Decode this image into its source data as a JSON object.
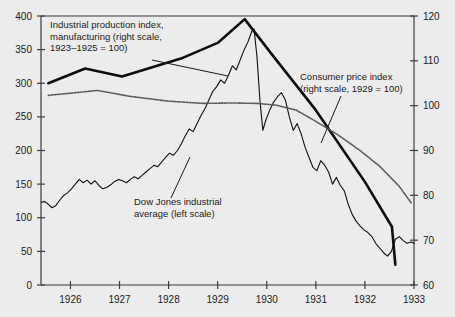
{
  "chart_data": {
    "type": "line",
    "title": "",
    "subtitle": "",
    "xlabel": "",
    "grid": false,
    "legend_position": "inline-annotations",
    "x": [
      1925.4,
      1933.0
    ],
    "xlim": [
      1925.4,
      1933.0
    ],
    "x_ticks": [
      1926,
      1927,
      1928,
      1929,
      1930,
      1931,
      1932,
      1933
    ],
    "x_tick_labels": [
      "1926",
      "1927",
      "1928",
      "1929",
      "1930",
      "1931",
      "1932",
      "1933"
    ],
    "left_axis": {
      "label": "",
      "ylim": [
        0,
        400
      ],
      "ticks": [
        0,
        50,
        100,
        150,
        200,
        250,
        300,
        350,
        400
      ],
      "tick_labels": [
        "0",
        "50",
        "100",
        "150",
        "200",
        "250",
        "300",
        "350",
        "400"
      ]
    },
    "right_axis": {
      "label": "",
      "ylim": [
        60,
        120
      ],
      "ticks": [
        60,
        70,
        80,
        90,
        100,
        110,
        120
      ],
      "tick_labels": [
        "60",
        "70",
        "80",
        "90",
        "100",
        "110",
        "120"
      ]
    },
    "series": [
      {
        "name": "Dow Jones industrial average (left scale)",
        "axis": "left",
        "style": "thin-solid",
        "color": "#111111",
        "points": [
          [
            1925.4,
            123
          ],
          [
            1925.48,
            124
          ],
          [
            1925.55,
            120
          ],
          [
            1925.62,
            115
          ],
          [
            1925.7,
            118
          ],
          [
            1925.78,
            126
          ],
          [
            1925.86,
            133
          ],
          [
            1925.94,
            137
          ],
          [
            1926.02,
            143
          ],
          [
            1926.1,
            150
          ],
          [
            1926.18,
            157
          ],
          [
            1926.26,
            152
          ],
          [
            1926.34,
            156
          ],
          [
            1926.42,
            150
          ],
          [
            1926.5,
            155
          ],
          [
            1926.58,
            148
          ],
          [
            1926.66,
            143
          ],
          [
            1926.74,
            145
          ],
          [
            1926.82,
            149
          ],
          [
            1926.9,
            154
          ],
          [
            1926.98,
            157
          ],
          [
            1927.06,
            155
          ],
          [
            1927.14,
            152
          ],
          [
            1927.22,
            157
          ],
          [
            1927.3,
            161
          ],
          [
            1927.38,
            158
          ],
          [
            1927.46,
            163
          ],
          [
            1927.54,
            168
          ],
          [
            1927.62,
            173
          ],
          [
            1927.7,
            178
          ],
          [
            1927.78,
            176
          ],
          [
            1927.86,
            183
          ],
          [
            1927.94,
            190
          ],
          [
            1928.02,
            196
          ],
          [
            1928.1,
            193
          ],
          [
            1928.18,
            200
          ],
          [
            1928.26,
            210
          ],
          [
            1928.34,
            222
          ],
          [
            1928.42,
            232
          ],
          [
            1928.5,
            228
          ],
          [
            1928.58,
            240
          ],
          [
            1928.66,
            252
          ],
          [
            1928.74,
            262
          ],
          [
            1928.82,
            275
          ],
          [
            1928.9,
            288
          ],
          [
            1928.98,
            295
          ],
          [
            1929.06,
            305
          ],
          [
            1929.14,
            300
          ],
          [
            1929.22,
            312
          ],
          [
            1929.3,
            326
          ],
          [
            1929.38,
            320
          ],
          [
            1929.46,
            335
          ],
          [
            1929.54,
            350
          ],
          [
            1929.62,
            362
          ],
          [
            1929.7,
            378
          ],
          [
            1929.74,
            381
          ],
          [
            1929.8,
            340
          ],
          [
            1929.86,
            275
          ],
          [
            1929.92,
            230
          ],
          [
            1929.98,
            245
          ],
          [
            1930.06,
            260
          ],
          [
            1930.14,
            272
          ],
          [
            1930.22,
            280
          ],
          [
            1930.3,
            286
          ],
          [
            1930.38,
            275
          ],
          [
            1930.46,
            250
          ],
          [
            1930.54,
            230
          ],
          [
            1930.62,
            240
          ],
          [
            1930.7,
            225
          ],
          [
            1930.78,
            205
          ],
          [
            1930.86,
            190
          ],
          [
            1930.94,
            175
          ],
          [
            1931.02,
            170
          ],
          [
            1931.1,
            185
          ],
          [
            1931.18,
            178
          ],
          [
            1931.26,
            168
          ],
          [
            1931.34,
            150
          ],
          [
            1931.42,
            160
          ],
          [
            1931.5,
            148
          ],
          [
            1931.58,
            140
          ],
          [
            1931.66,
            120
          ],
          [
            1931.74,
            105
          ],
          [
            1931.82,
            95
          ],
          [
            1931.9,
            88
          ],
          [
            1931.98,
            82
          ],
          [
            1932.06,
            78
          ],
          [
            1932.14,
            72
          ],
          [
            1932.22,
            62
          ],
          [
            1932.3,
            55
          ],
          [
            1932.38,
            48
          ],
          [
            1932.46,
            43
          ],
          [
            1932.54,
            50
          ],
          [
            1932.62,
            68
          ],
          [
            1932.7,
            72
          ],
          [
            1932.78,
            66
          ],
          [
            1932.86,
            62
          ],
          [
            1932.94,
            64
          ],
          [
            1933.0,
            62
          ]
        ]
      },
      {
        "name": "Industrial production index, manufacturing (right scale, 1923–1925 = 100)",
        "axis": "right",
        "style": "thick-solid",
        "color": "#0d0d0d",
        "points": [
          [
            1925.55,
            105.0
          ],
          [
            1926.3,
            108.3
          ],
          [
            1927.05,
            106.5
          ],
          [
            1928.25,
            110.5
          ],
          [
            1929.0,
            114.0
          ],
          [
            1929.55,
            119.3
          ],
          [
            1930.1,
            111.5
          ],
          [
            1931.0,
            99.0
          ],
          [
            1932.0,
            83.0
          ],
          [
            1932.55,
            73.0
          ],
          [
            1932.62,
            64.5
          ]
        ]
      },
      {
        "name": "Consumer price index (right scale, 1929 = 100)",
        "axis": "right",
        "style": "dotted",
        "color": "#5a5a5a",
        "points": [
          [
            1925.55,
            102.3
          ],
          [
            1926.2,
            103.0
          ],
          [
            1926.55,
            103.4
          ],
          [
            1927.2,
            102.1
          ],
          [
            1928.0,
            101.0
          ],
          [
            1928.7,
            100.5
          ],
          [
            1929.3,
            100.6
          ],
          [
            1929.8,
            100.5
          ],
          [
            1930.2,
            100.1
          ],
          [
            1930.6,
            99.0
          ],
          [
            1931.0,
            96.5
          ],
          [
            1931.45,
            93.5
          ],
          [
            1931.9,
            90.0
          ],
          [
            1932.3,
            86.5
          ],
          [
            1932.7,
            82.0
          ],
          [
            1932.95,
            78.2
          ]
        ]
      }
    ],
    "annotations": [
      {
        "id": "industrial-production-label",
        "lines": [
          "Industrial production index,",
          "manufacturing (right scale,",
          "1923–1925 = 100)"
        ],
        "x": 50,
        "y": 28,
        "leader": [
          [
            152,
            60
          ],
          [
            228,
            76
          ]
        ]
      },
      {
        "id": "consumer-price-index-label",
        "lines": [
          "Consumer price index",
          "(right scale, 1929 = 100)"
        ],
        "x": 300,
        "y": 80,
        "leader": [
          [
            341,
            96
          ],
          [
            321,
            143
          ]
        ]
      },
      {
        "id": "dow-jones-label",
        "lines": [
          "Dow Jones industrial",
          "average (left scale)"
        ],
        "x": 134,
        "y": 205,
        "leader": [
          [
            171,
            198
          ],
          [
            190,
            157
          ]
        ]
      }
    ]
  },
  "colors": {
    "background": "#ececed",
    "axis": "#3c3c3c",
    "text": "#1a1a1a",
    "dow_jones": "#111111",
    "industrial_production": "#0d0d0d",
    "consumer_price_index": "#5a5a5a"
  }
}
